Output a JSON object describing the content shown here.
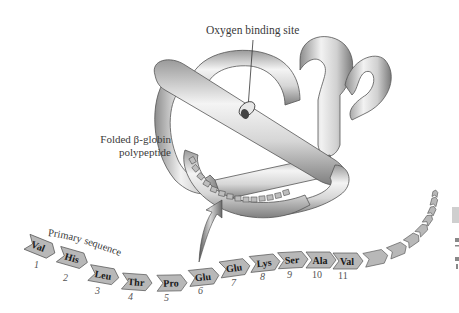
{
  "figure": {
    "labels": {
      "oxygen_site": "Oxygen binding site",
      "folded_line1": "Folded β-globin",
      "folded_line2": "polypeptide",
      "primary_sequence": "Primary sequence"
    },
    "residues": [
      {
        "name": "Val",
        "pos": "1"
      },
      {
        "name": "His",
        "pos": "2"
      },
      {
        "name": "Leu",
        "pos": "3"
      },
      {
        "name": "Thr",
        "pos": "4"
      },
      {
        "name": "Pro",
        "pos": "5"
      },
      {
        "name": "Glu",
        "pos": "6"
      },
      {
        "name": "Glu",
        "pos": "7"
      },
      {
        "name": "Lys",
        "pos": "8"
      },
      {
        "name": "Ser",
        "pos": "9"
      },
      {
        "name": "Ala",
        "pos": "10"
      },
      {
        "name": "Val",
        "pos": "11"
      }
    ],
    "colors": {
      "residue_fill": "#b8b8b8",
      "residue_stroke": "#555555",
      "ribbon_light": "#f2f2f2",
      "ribbon_dark": "#8a8a8a",
      "text": "#3a3a3a"
    }
  }
}
